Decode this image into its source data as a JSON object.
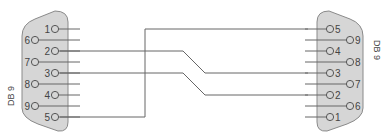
{
  "left_connector": {
    "label": "DB 9",
    "pins": [
      {
        "n": "1",
        "y": 29,
        "col": "inner"
      },
      {
        "n": "6",
        "y": 40,
        "col": "outer"
      },
      {
        "n": "2",
        "y": 51,
        "col": "inner"
      },
      {
        "n": "7",
        "y": 62,
        "col": "outer"
      },
      {
        "n": "3",
        "y": 73,
        "col": "inner"
      },
      {
        "n": "8",
        "y": 84,
        "col": "outer"
      },
      {
        "n": "4",
        "y": 95,
        "col": "inner"
      },
      {
        "n": "9",
        "y": 106,
        "col": "outer"
      },
      {
        "n": "5",
        "y": 117,
        "col": "inner"
      }
    ]
  },
  "right_connector": {
    "label": "DB 9",
    "pins": [
      {
        "n": "5",
        "y": 29,
        "col": "inner"
      },
      {
        "n": "9",
        "y": 40,
        "col": "outer"
      },
      {
        "n": "4",
        "y": 51,
        "col": "inner"
      },
      {
        "n": "8",
        "y": 62,
        "col": "outer"
      },
      {
        "n": "3",
        "y": 73,
        "col": "inner"
      },
      {
        "n": "7",
        "y": 84,
        "col": "outer"
      },
      {
        "n": "2",
        "y": 95,
        "col": "inner"
      },
      {
        "n": "6",
        "y": 106,
        "col": "outer"
      },
      {
        "n": "1",
        "y": 117,
        "col": "inner"
      }
    ]
  },
  "connections": [
    {
      "from": "L2",
      "to": "R3"
    },
    {
      "from": "L3",
      "to": "R2"
    },
    {
      "from": "L5",
      "to": "R5"
    }
  ],
  "colors": {
    "body": "#d4d4d4",
    "outline": "#888888",
    "wire": "#666666"
  }
}
